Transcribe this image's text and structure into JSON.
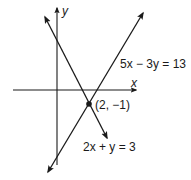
{
  "diagram": {
    "type": "graph-of-linear-system",
    "axes": {
      "x_label": "x",
      "y_label": "y"
    },
    "lines": [
      {
        "equation": "5x − 3y = 13",
        "label": "5x − 3y = 13"
      },
      {
        "equation": "2x + y = 3",
        "label": "2x + y = 3"
      }
    ],
    "intersection": {
      "label": "(2, −1)",
      "x": 2,
      "y": -1
    },
    "colors": {
      "ink": "#1a1a1a",
      "background": "#ffffff"
    }
  }
}
